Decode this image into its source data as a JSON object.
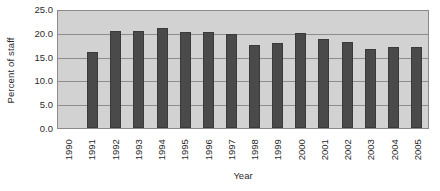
{
  "chart_data": {
    "type": "bar",
    "title": "",
    "xlabel": "Year",
    "ylabel": "Percent of staff",
    "categories": [
      "1990",
      "1991",
      "1992",
      "1993",
      "1994",
      "1995",
      "1996",
      "1997",
      "1998",
      "1999",
      "2000",
      "2001",
      "2002",
      "2003",
      "2004",
      "2005"
    ],
    "values": [
      null,
      16.2,
      20.7,
      20.7,
      21.4,
      20.5,
      20.5,
      20.0,
      17.8,
      18.1,
      20.3,
      19.0,
      18.3,
      16.9,
      17.4,
      17.4
    ],
    "series": [
      {
        "name": "Percent of staff",
        "values": [
          null,
          16.2,
          20.7,
          20.7,
          21.4,
          20.5,
          20.5,
          20.0,
          17.8,
          18.1,
          20.3,
          19.0,
          18.3,
          16.9,
          17.4,
          17.4
        ]
      }
    ],
    "ylim": [
      0.0,
      25.0
    ],
    "yticks": [
      "0.0",
      "5.0",
      "10.0",
      "15.0",
      "20.0",
      "25.0"
    ],
    "ytick_values": [
      0.0,
      5.0,
      10.0,
      15.0,
      20.0,
      25.0
    ],
    "grid": true,
    "legend": null,
    "legend_position": "none",
    "colors": {
      "bar": "#4a4a4a",
      "plot_background": "#d2d2d2",
      "gridline": "#8d8d8d",
      "axis_border": "#8a8a8a",
      "text": "#2b2b2b",
      "figure_background": "#ffffff"
    }
  }
}
